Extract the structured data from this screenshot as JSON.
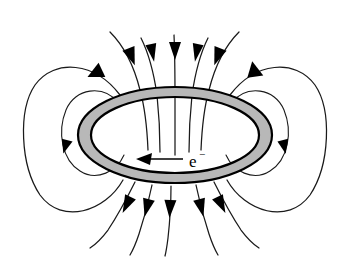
{
  "figure": {
    "background_color": "#ffffff",
    "ring": {
      "name": "current-carrying ring",
      "fill_color": "#b8b8b8",
      "outline_color": "#000000",
      "center_x": 175,
      "center_y": 135,
      "outer_rx": 97,
      "outer_ry": 48,
      "inner_rx": 84,
      "inner_ry": 38
    },
    "current_indicator": {
      "label": "e",
      "superscript": "−",
      "direction": "leftward",
      "arrow_tip_x": 139,
      "arrow_tail_x": 183,
      "arrow_y": 159
    },
    "field_lines": {
      "stroke_color": "#1a1a1a",
      "arrowhead_color": "#000000",
      "top_line_count": 7,
      "bottom_line_count": 7,
      "side_loop_count": 4,
      "description": "Dipole magnetic field lines entering the loop from above and exiting below, closing through large side loops"
    },
    "labels": {
      "electron_flow": "e−"
    }
  }
}
